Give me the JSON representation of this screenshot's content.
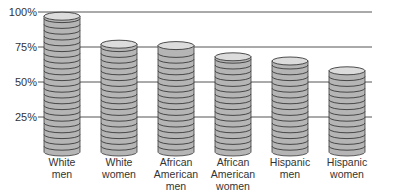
{
  "chart_data": {
    "type": "bar",
    "style": "coin-stack pictogram",
    "title": "",
    "xlabel": "",
    "ylabel": "",
    "ylim": [
      0,
      100
    ],
    "yticks": [
      "25%",
      "50%",
      "75%",
      "100%"
    ],
    "grid": true,
    "legend": null,
    "categories": [
      [
        "White",
        "men"
      ],
      [
        "White",
        "women"
      ],
      [
        "African",
        "American",
        "men"
      ],
      [
        "African",
        "American",
        "women"
      ],
      [
        "Hispanic",
        "men"
      ],
      [
        "Hispanic",
        "women"
      ]
    ],
    "category_labels": [
      "White men",
      "White women",
      "African American men",
      "African American women",
      "Hispanic men",
      "Hispanic women"
    ],
    "values": [
      97,
      77,
      76,
      68,
      65,
      58
    ],
    "colors": {
      "coin_fill": "#b5b5b5",
      "coin_top": "#dcdcdc",
      "coin_line": "#3a3a3a",
      "grid": "#555555",
      "text": "#333333"
    }
  }
}
